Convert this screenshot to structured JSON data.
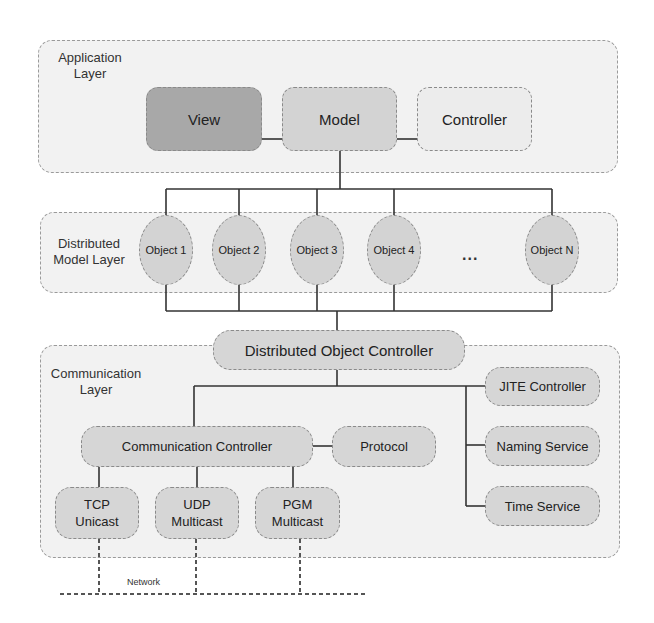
{
  "diagram": {
    "layers": {
      "application": {
        "label_line1": "Application",
        "label_line2": "Layer"
      },
      "distributed_model": {
        "label_line1": "Distributed",
        "label_line2": "Model Layer"
      },
      "communication": {
        "label_line1": "Communication",
        "label_line2": "Layer"
      }
    },
    "application_nodes": {
      "view": "View",
      "model": "Model",
      "controller": "Controller"
    },
    "objects": [
      "Object 1",
      "Object 2",
      "Object 3",
      "Object 4",
      "Object N"
    ],
    "ellipsis": "...",
    "distributed_object_controller": "Distributed Object Controller",
    "communication_nodes": {
      "communication_controller": "Communication Controller",
      "protocol": "Protocol",
      "jite_controller": "JITE Controller",
      "naming_service": "Naming Service",
      "time_service": "Time Service"
    },
    "transports": [
      {
        "line1": "TCP",
        "line2": "Unicast"
      },
      {
        "line1": "UDP",
        "line2": "Multicast"
      },
      {
        "line1": "PGM",
        "line2": "Multicast"
      }
    ],
    "network_label": "Network",
    "colors": {
      "view_fill": "#a8a8a8",
      "model_fill": "#d3d3d3",
      "controller_fill": "#ececec",
      "layer_fill": "#f2f2f2",
      "node_fill": "#d6d6d6",
      "line": "#333333"
    }
  }
}
